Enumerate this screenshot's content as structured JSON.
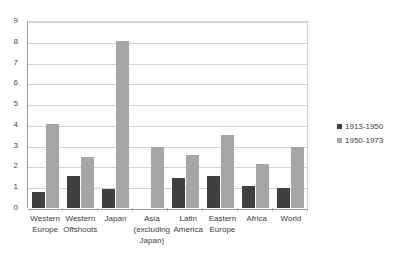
{
  "chart_data": {
    "type": "bar",
    "title": "",
    "subtitle": "",
    "xlabel": "",
    "ylabel": "",
    "ylim": [
      0,
      9
    ],
    "ytick_step": 1,
    "ytick_labels": [
      "9",
      "8",
      "7",
      "6",
      "5",
      "4",
      "3",
      "2",
      "1",
      "0"
    ],
    "grid": true,
    "legend_position": "right",
    "categories": [
      "Western Europe",
      "Western Offshoots",
      "Japan",
      "Asia (excluding Japan)",
      "Latin America",
      "Eastern Europe",
      "Africa",
      "World"
    ],
    "series": [
      {
        "name": "1913-1950",
        "color": "#404040",
        "values": [
          0.75,
          1.55,
          0.9,
          0,
          1.45,
          1.55,
          1.05,
          0.95
        ]
      },
      {
        "name": "1950-1973",
        "color": "#a6a6a6",
        "values": [
          4.05,
          2.45,
          8.05,
          2.95,
          2.55,
          3.5,
          2.1,
          2.95
        ]
      }
    ]
  },
  "legend": {
    "items": [
      {
        "label": "1913-1950",
        "swatch": "legend-swatch-dark"
      },
      {
        "label": "1950-1973",
        "swatch": "legend-swatch-light"
      }
    ]
  },
  "colors": {
    "series_1913_1950": "#404040",
    "series_1950_1973": "#a6a6a6",
    "gridline": "#d4d4d4",
    "axis": "#9c9c9c",
    "text": "#3d3d3d",
    "background": "#ffffff"
  }
}
